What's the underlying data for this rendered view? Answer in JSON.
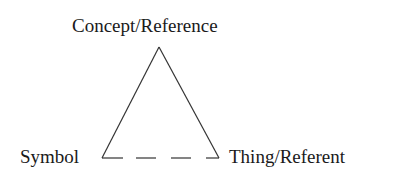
{
  "diagram": {
    "nodes": {
      "top": {
        "label": "Concept/Reference"
      },
      "left": {
        "label": "Symbol"
      },
      "right": {
        "label": "Thing/Referent"
      }
    },
    "edges": [
      {
        "from": "top",
        "to": "left",
        "style": "solid"
      },
      {
        "from": "top",
        "to": "right",
        "style": "solid"
      },
      {
        "from": "left",
        "to": "right",
        "style": "dashed"
      }
    ],
    "colors": {
      "stroke": "#333333",
      "text": "#1a1a1a",
      "background": "#ffffff"
    }
  }
}
